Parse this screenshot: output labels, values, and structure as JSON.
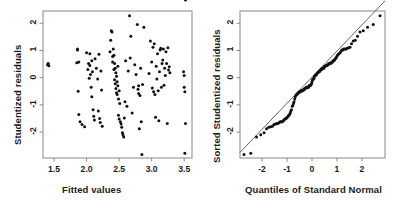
{
  "figure": {
    "background": "#ffffff",
    "ink": "#1a1a1a",
    "point_color": "#111111",
    "line_color": "#555555",
    "frame_color": "#888888"
  },
  "chart_data": [
    {
      "type": "scatter",
      "name": "residuals-vs-fitted",
      "title": "",
      "xlabel": "Fitted values",
      "ylabel": "Studentized residuals",
      "xlim": [
        1.33,
        3.62
      ],
      "ylim": [
        -2.95,
        2.45
      ],
      "xticks": [
        1.5,
        2.0,
        2.5,
        3.0,
        3.5
      ],
      "xticklabels": [
        "1.5",
        "2.0",
        "2.5",
        "3.0",
        "3.5"
      ],
      "yticks": [
        -2,
        -1,
        0,
        1,
        2
      ],
      "yticklabels": [
        "-2",
        "-1",
        "0",
        "1",
        "2"
      ],
      "grid": false,
      "legend": "none",
      "x": [
        1.4,
        1.41,
        1.42,
        1.85,
        1.86,
        1.86,
        1.87,
        1.88,
        1.88,
        1.9,
        1.93,
        1.97,
        2.0,
        2.02,
        2.03,
        2.04,
        2.05,
        2.05,
        2.06,
        2.07,
        2.08,
        2.08,
        2.09,
        2.1,
        2.11,
        2.12,
        2.13,
        2.15,
        2.17,
        2.18,
        2.19,
        2.2,
        2.21,
        2.22,
        2.23,
        2.24,
        2.36,
        2.37,
        2.38,
        2.39,
        2.4,
        2.4,
        2.41,
        2.42,
        2.42,
        2.43,
        2.43,
        2.44,
        2.44,
        2.45,
        2.45,
        2.46,
        2.46,
        2.47,
        2.47,
        2.48,
        2.48,
        2.49,
        2.49,
        2.5,
        2.5,
        2.51,
        2.52,
        2.53,
        2.54,
        2.55,
        2.56,
        2.57,
        2.58,
        2.59,
        2.6,
        2.62,
        2.64,
        2.66,
        2.67,
        2.68,
        2.7,
        2.72,
        2.74,
        2.76,
        2.78,
        2.79,
        2.8,
        2.8,
        2.81,
        2.82,
        2.83,
        2.84,
        2.85,
        2.86,
        2.88,
        2.96,
        2.98,
        3.0,
        3.01,
        3.02,
        3.03,
        3.04,
        3.05,
        3.06,
        3.07,
        3.08,
        3.09,
        3.1,
        3.11,
        3.12,
        3.13,
        3.14,
        3.15,
        3.16,
        3.17,
        3.18,
        3.19,
        3.2,
        3.21,
        3.22,
        3.23,
        3.24,
        3.25,
        3.26,
        3.27,
        3.28,
        3.49,
        3.5,
        3.5,
        3.51,
        3.51,
        3.52,
        3.52
      ],
      "y": [
        0.48,
        0.52,
        0.44,
        0.55,
        1.02,
        1.05,
        -0.5,
        -1.35,
        0.58,
        -1.62,
        -1.72,
        -1.8,
        0.92,
        0.3,
        0.52,
        -0.02,
        0.88,
        0.45,
        0.12,
        -0.35,
        0.62,
        -0.7,
        0.22,
        -1.18,
        -1.42,
        -1.55,
        0.7,
        0.35,
        -0.05,
        -1.22,
        0.86,
        -1.5,
        -1.65,
        0.25,
        -0.45,
        -1.78,
        0.95,
        1.38,
        1.72,
        1.68,
        0.78,
        0.58,
        1.05,
        0.82,
        0.3,
        0.52,
        -0.08,
        0.35,
        -0.22,
        0.18,
        -0.4,
        0.05,
        -0.55,
        -0.15,
        -0.62,
        0.42,
        -0.3,
        -0.78,
        -1.38,
        -0.48,
        -1.52,
        -0.95,
        -1.62,
        -1.7,
        -1.82,
        -2.02,
        -2.1,
        -2.18,
        -1.48,
        -0.88,
        0.62,
        -1.05,
        0.25,
        2.28,
        0.72,
        1.52,
        -1.3,
        -0.35,
        0.48,
        0.12,
        1.95,
        -0.42,
        -0.58,
        -0.3,
        -1.88,
        -0.65,
        0.35,
        -1.62,
        -2.82,
        -0.25,
        1.85,
        0.15,
        1.35,
        0.58,
        -0.38,
        1.12,
        -0.52,
        1.25,
        -0.62,
        -1.45,
        0.42,
        -0.05,
        0.88,
        -0.48,
        -1.58,
        0.22,
        1.02,
        1.08,
        -0.35,
        0.52,
        0.65,
        1.05,
        -0.28,
        0.35,
        0.08,
        0.95,
        0.52,
        -1.68,
        1.1,
        0.28,
        0.4,
        0.18,
        0.22,
        0.08,
        -0.35,
        -0.52,
        -2.78,
        -1.68
      ]
    },
    {
      "type": "scatter",
      "name": "normal-qq-plot",
      "title": "",
      "xlabel": "Quantiles of Standard Normal",
      "ylabel": "Sorted Studentized residuals",
      "xlim": [
        -2.88,
        2.92
      ],
      "ylim": [
        -2.95,
        2.45
      ],
      "xticks": [
        -2,
        -1,
        0,
        1,
        2
      ],
      "xticklabels": [
        "-2",
        "-1",
        "0",
        "1",
        "2"
      ],
      "yticks": [
        -2,
        -1,
        0,
        1,
        2
      ],
      "yticklabels": [
        "-2",
        "-1",
        "0",
        "1",
        "2"
      ],
      "grid": false,
      "legend": "none",
      "reference_line": {
        "slope": 0.96,
        "intercept": 0.02,
        "color": "#555555"
      },
      "x": [
        -2.72,
        -2.45,
        -2.22,
        -2.05,
        -1.92,
        -1.82,
        -1.73,
        -1.65,
        -1.58,
        -1.52,
        -1.46,
        -1.41,
        -1.36,
        -1.31,
        -1.27,
        -1.23,
        -1.19,
        -1.15,
        -1.12,
        -1.08,
        -1.05,
        -1.02,
        -0.99,
        -0.96,
        -0.93,
        -0.9,
        -0.87,
        -0.85,
        -0.82,
        -0.79,
        -0.77,
        -0.74,
        -0.72,
        -0.69,
        -0.67,
        -0.65,
        -0.62,
        -0.6,
        -0.58,
        -0.55,
        -0.53,
        -0.51,
        -0.49,
        -0.47,
        -0.45,
        -0.43,
        -0.4,
        -0.38,
        -0.36,
        -0.34,
        -0.32,
        -0.3,
        -0.28,
        -0.26,
        -0.24,
        -0.22,
        -0.2,
        -0.18,
        -0.16,
        -0.14,
        -0.12,
        -0.1,
        -0.08,
        -0.06,
        -0.04,
        -0.02,
        0.0,
        0.02,
        0.04,
        0.06,
        0.08,
        0.1,
        0.12,
        0.14,
        0.16,
        0.18,
        0.2,
        0.22,
        0.24,
        0.26,
        0.28,
        0.3,
        0.32,
        0.34,
        0.36,
        0.38,
        0.4,
        0.43,
        0.45,
        0.47,
        0.49,
        0.51,
        0.53,
        0.55,
        0.58,
        0.6,
        0.62,
        0.65,
        0.67,
        0.69,
        0.72,
        0.74,
        0.77,
        0.79,
        0.82,
        0.85,
        0.87,
        0.9,
        0.93,
        0.96,
        0.99,
        1.02,
        1.05,
        1.08,
        1.12,
        1.15,
        1.19,
        1.23,
        1.27,
        1.31,
        1.36,
        1.41,
        1.46,
        1.52,
        1.58,
        1.65,
        1.73,
        1.82,
        1.92,
        2.05,
        2.22,
        2.45,
        2.72
      ],
      "y": [
        -2.82,
        -2.78,
        -2.18,
        -2.1,
        -2.02,
        -1.88,
        -1.82,
        -1.8,
        -1.78,
        -1.72,
        -1.7,
        -1.68,
        -1.68,
        -1.65,
        -1.62,
        -1.62,
        -1.62,
        -1.58,
        -1.55,
        -1.52,
        -1.5,
        -1.48,
        -1.45,
        -1.42,
        -1.38,
        -1.35,
        -1.3,
        -1.22,
        -1.18,
        -1.05,
        -1.02,
        -0.95,
        -0.88,
        -0.78,
        -0.7,
        -0.65,
        -0.62,
        -0.62,
        -0.58,
        -0.55,
        -0.55,
        -0.52,
        -0.52,
        -0.52,
        -0.5,
        -0.48,
        -0.48,
        -0.48,
        -0.45,
        -0.45,
        -0.42,
        -0.42,
        -0.4,
        -0.38,
        -0.38,
        -0.35,
        -0.35,
        -0.35,
        -0.35,
        -0.35,
        -0.3,
        -0.3,
        -0.3,
        -0.28,
        -0.25,
        -0.22,
        -0.15,
        -0.08,
        -0.05,
        -0.05,
        -0.02,
        0.05,
        0.08,
        0.08,
        0.12,
        0.12,
        0.15,
        0.18,
        0.18,
        0.22,
        0.22,
        0.25,
        0.25,
        0.28,
        0.3,
        0.3,
        0.35,
        0.35,
        0.35,
        0.35,
        0.4,
        0.42,
        0.42,
        0.44,
        0.45,
        0.45,
        0.48,
        0.48,
        0.52,
        0.52,
        0.52,
        0.52,
        0.55,
        0.58,
        0.58,
        0.62,
        0.62,
        0.65,
        0.7,
        0.72,
        0.78,
        0.82,
        0.86,
        0.88,
        0.92,
        0.95,
        1.02,
        1.02,
        1.05,
        1.05,
        1.05,
        1.08,
        1.1,
        1.12,
        1.25,
        1.35,
        1.38,
        1.52,
        1.68,
        1.72,
        1.85,
        1.95,
        2.28
      ]
    }
  ]
}
